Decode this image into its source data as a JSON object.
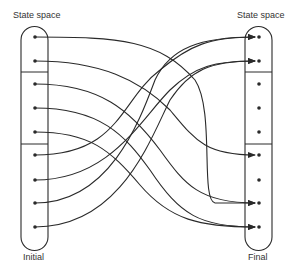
{
  "labels": {
    "left_top": "State space",
    "right_top": "State space",
    "left_bottom": "Initial",
    "right_bottom": "Final"
  },
  "colors": {
    "line": "#2a2a2a",
    "text": "#333333",
    "background": "#ffffff"
  },
  "left_states": [
    37,
    61,
    84,
    108,
    132,
    155,
    180,
    203,
    227
  ],
  "right_states": [
    37,
    61,
    84,
    108,
    132,
    155,
    180,
    203,
    227
  ],
  "partition_dividers_y": [
    72,
    144
  ],
  "mappings": [
    {
      "from": 1,
      "to": 8
    },
    {
      "from": 2,
      "to": 6
    },
    {
      "from": 3,
      "to": 8
    },
    {
      "from": 4,
      "to": 9
    },
    {
      "from": 5,
      "to": 9
    },
    {
      "from": 6,
      "to": 1
    },
    {
      "from": 7,
      "to": 2
    },
    {
      "from": 8,
      "to": 1
    },
    {
      "from": 9,
      "to": 2
    }
  ]
}
